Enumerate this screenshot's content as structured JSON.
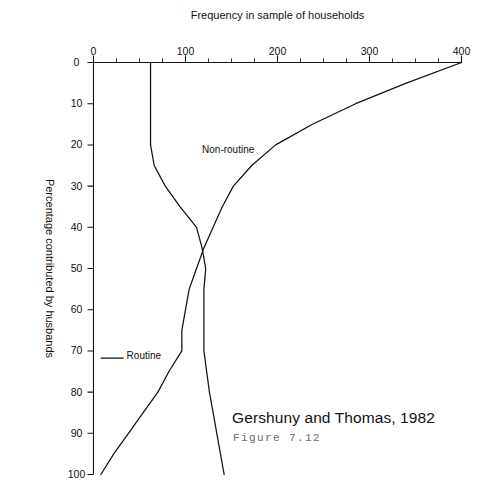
{
  "figure": {
    "title": "Gershuny and Thomas, 1982",
    "caption": "Figure 7.12"
  },
  "chart_data": {
    "type": "line",
    "title": "Gershuny and Thomas, 1982",
    "orientation": "rotated-90-clockwise",
    "xlabel": "Percentage contributed by husbands",
    "ylabel": "Frequency in sample of households",
    "xlim": [
      0,
      100
    ],
    "ylim": [
      0,
      400
    ],
    "xticks": [
      0,
      10,
      20,
      30,
      40,
      50,
      60,
      70,
      80,
      90,
      100
    ],
    "xticklabels": [
      "0",
      "10",
      "20",
      "30",
      "40",
      "50",
      "60",
      "70",
      "80",
      "90",
      "100"
    ],
    "yticks": [
      0,
      100,
      200,
      300,
      400
    ],
    "yticklabels": [
      "0",
      "100",
      "200",
      "300",
      "400"
    ],
    "y_minor_tick_step": 25,
    "grid": false,
    "legend": "inline-labels",
    "series": [
      {
        "name": "Non-routine",
        "label_position": {
          "x": 22,
          "y": 118
        },
        "x": [
          0,
          5,
          10,
          15,
          20,
          25,
          30,
          35,
          40,
          45,
          50,
          55,
          60,
          65,
          70,
          75,
          80,
          85,
          90,
          95,
          100
        ],
        "values": [
          400,
          340,
          285,
          238,
          198,
          172,
          152,
          140,
          130,
          120,
          112,
          104,
          100,
          96,
          96,
          82,
          70,
          54,
          38,
          22,
          8
        ]
      },
      {
        "name": "Routine",
        "label_position": {
          "x": 72,
          "y": 36
        },
        "x": [
          0,
          5,
          10,
          15,
          20,
          25,
          30,
          35,
          40,
          45,
          50,
          55,
          60,
          65,
          70,
          75,
          80,
          85,
          90,
          95,
          100
        ],
        "values": [
          62,
          62,
          62,
          62,
          62,
          66,
          78,
          94,
          112,
          118,
          122,
          120,
          120,
          120,
          120,
          123,
          126,
          130,
          134,
          138,
          142
        ]
      }
    ]
  }
}
